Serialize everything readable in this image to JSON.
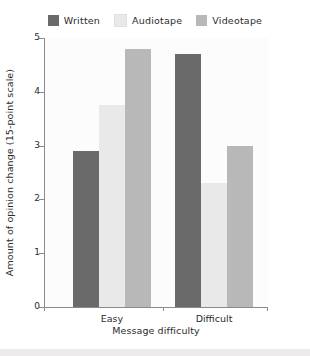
{
  "chart_data": {
    "type": "bar",
    "title": "",
    "categories": [
      "Easy",
      "Difficult"
    ],
    "series": [
      {
        "name": "Written",
        "values": [
          2.9,
          4.7
        ],
        "color": "#6a6a6a"
      },
      {
        "name": "Audiotape",
        "values": [
          3.75,
          2.3
        ],
        "color": "#e9e9e9"
      },
      {
        "name": "Videotape",
        "values": [
          4.8,
          3.0
        ],
        "color": "#b8b8b8"
      }
    ],
    "xlabel": "Message difficulty",
    "ylabel": "Amount of opinion change (15-point scale)",
    "ylim": [
      0,
      5
    ],
    "yticks": [
      0,
      1,
      2,
      3,
      4,
      5
    ],
    "ytick_labels": [
      "0",
      "1",
      "2",
      "3",
      "4",
      "5"
    ],
    "grid": false,
    "legend_position": "top"
  },
  "legend": {
    "entries": [
      {
        "label": "Written"
      },
      {
        "label": "Audiotape"
      },
      {
        "label": "Videotape"
      }
    ]
  },
  "axes": {
    "y_title": "Amount of opinion change (15-point scale)",
    "x_title": "Message difficulty",
    "y_tick_labels": [
      "5",
      "4",
      "3",
      "2",
      "1",
      "0"
    ],
    "x_group_labels": [
      "Easy",
      "Difficult"
    ]
  }
}
